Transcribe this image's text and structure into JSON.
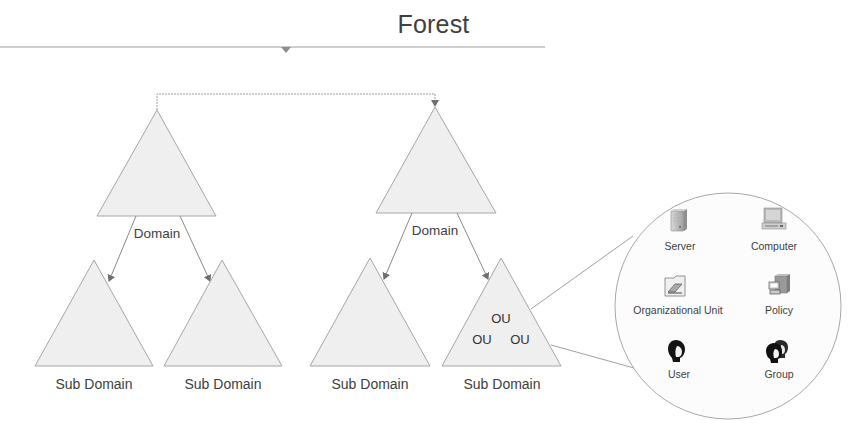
{
  "title": "Forest",
  "colors": {
    "line": "#9a9a9a",
    "triangle_fill": "#efefef",
    "triangle_stroke": "#a6a6a6",
    "text": "#404040",
    "circle_fill": "#fcfcfc"
  },
  "domains": [
    {
      "label": "Domain",
      "subdomains": [
        {
          "label": "Sub Domain"
        },
        {
          "label": "Sub Domain"
        }
      ]
    },
    {
      "label": "Domain",
      "subdomains": [
        {
          "label": "Sub Domain"
        },
        {
          "label": "Sub Domain",
          "ous": [
            "OU",
            "OU",
            "OU"
          ]
        }
      ]
    }
  ],
  "zoom_circle": {
    "items": [
      {
        "label": "Server",
        "icon": "server-icon"
      },
      {
        "label": "Computer",
        "icon": "computer-icon"
      },
      {
        "label": "Organizational Unit",
        "icon": "organizational-unit-icon"
      },
      {
        "label": "Policy",
        "icon": "policy-icon"
      },
      {
        "label": "User",
        "icon": "user-icon"
      },
      {
        "label": "Group",
        "icon": "group-icon"
      }
    ]
  }
}
